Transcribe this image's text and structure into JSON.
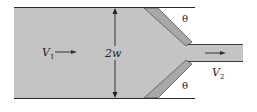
{
  "diagram": {
    "labels": {
      "inlet_velocity": "V",
      "inlet_velocity_sub": "1",
      "width": "2w",
      "outlet_velocity": "V",
      "outlet_velocity_sub": "2",
      "angle_top": "θ",
      "angle_bottom": "θ"
    },
    "colors": {
      "fluid": "#c4c4c4",
      "plate": "#a8a8a8",
      "lines": "#2a2a2a",
      "background": "#ffffff"
    }
  }
}
